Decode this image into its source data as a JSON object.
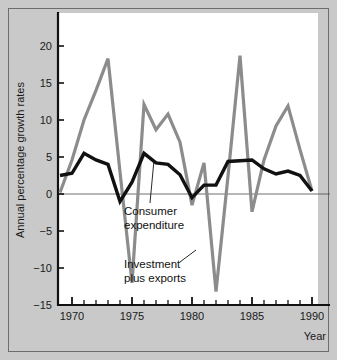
{
  "chart_data": {
    "type": "line",
    "title": "",
    "xlabel": "Year",
    "ylabel": "Annual percentage growth rates",
    "xlim": [
      1969,
      1990.5
    ],
    "ylim": [
      -15,
      23
    ],
    "grid": false,
    "zero_line": true,
    "legend_position": "inline-annotations",
    "y_ticks": [
      20,
      15,
      10,
      5,
      0,
      -5,
      -10,
      -15
    ],
    "y_tick_labels": [
      "20",
      "15",
      "10",
      "5",
      "0",
      "−5",
      "−10",
      "−15"
    ],
    "x_ticks": [
      1970,
      1975,
      1980,
      1985,
      1990
    ],
    "x_tick_labels": [
      "1970",
      "1975",
      "1980",
      "1985",
      "1990"
    ],
    "x_minor_tick_interval": 1,
    "x": [
      1969,
      1970,
      1971,
      1972,
      1973,
      1974,
      1975,
      1976,
      1977,
      1978,
      1979,
      1980,
      1981,
      1982,
      1983,
      1984,
      1985,
      1986,
      1987,
      1988,
      1989,
      1990
    ],
    "series": [
      {
        "name": "Investment plus exports",
        "color": "#8c8c8c",
        "width": 3.2,
        "values": [
          0.2,
          4.6,
          10.0,
          14.0,
          18.3,
          3.0,
          -12.0,
          12.1,
          8.7,
          10.8,
          7.0,
          -1.5,
          4.2,
          -13.2,
          2.4,
          18.7,
          -2.4,
          4.6,
          9.2,
          11.9,
          6.0,
          0.4
        ]
      },
      {
        "name": "Consumer expenditure",
        "color": "#111111",
        "width": 3.4,
        "values": [
          2.5,
          2.8,
          5.5,
          4.6,
          4.0,
          -1.0,
          1.6,
          5.5,
          4.2,
          4.0,
          2.6,
          -0.5,
          1.2,
          1.2,
          4.4,
          4.5,
          4.6,
          3.4,
          2.7,
          3.1,
          2.5,
          0.4
        ]
      }
    ],
    "annotations": [
      {
        "label": "Consumer expenditure",
        "lines": [
          "Consumer",
          "expenditure"
        ],
        "target_x": 1978,
        "target_y": 4.0
      },
      {
        "label": "Investment plus exports",
        "lines": [
          "Investment",
          "plus exports"
        ],
        "target_x": 1982,
        "target_y": -6.0
      }
    ]
  },
  "axis": {
    "ylabel": "Annual percentage growth rates",
    "xlabel": "Year"
  }
}
